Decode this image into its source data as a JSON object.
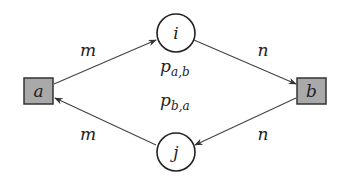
{
  "diagram": {
    "type": "petri-net-like graph",
    "colors": {
      "square_fill": "#a9a9a9",
      "stroke": "#333333",
      "edge": "#444444",
      "background": "#ffffff"
    },
    "nodes": {
      "a": {
        "label": "a",
        "shape": "square"
      },
      "b": {
        "label": "b",
        "shape": "square"
      },
      "i": {
        "label": "i",
        "shape": "circle"
      },
      "j": {
        "label": "j",
        "shape": "circle"
      }
    },
    "edges": [
      {
        "from": "a",
        "to": "i",
        "label": "m"
      },
      {
        "from": "i",
        "to": "b",
        "label": "n"
      },
      {
        "from": "b",
        "to": "j",
        "label": "n"
      },
      {
        "from": "j",
        "to": "a",
        "label": "m"
      }
    ],
    "annotations": {
      "p_ab_base": "p",
      "p_ab_sub": "a,b",
      "p_ba_base": "p",
      "p_ba_sub": "b,a"
    }
  }
}
